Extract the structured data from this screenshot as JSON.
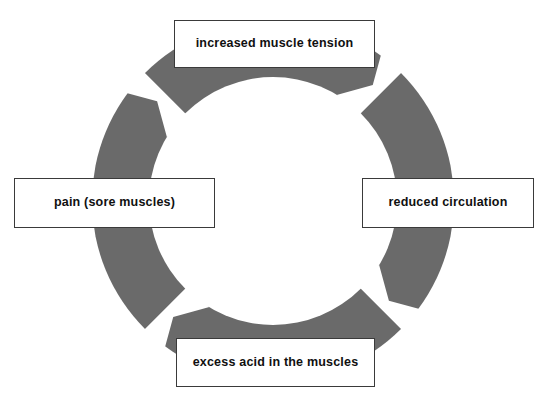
{
  "diagram": {
    "type": "cycle",
    "direction": "clockwise",
    "ring": {
      "color": "#6a6a6a",
      "center_x": 273,
      "center_y": 201,
      "outer_radius": 181,
      "inner_radius": 124,
      "arrow_count": 4
    },
    "box": {
      "fill": "#ffffff",
      "border_color": "#3a3a3a",
      "text_color": "#101010"
    },
    "nodes": [
      {
        "id": "tension",
        "position": "top",
        "label": "increased muscle tension"
      },
      {
        "id": "circulation",
        "position": "right",
        "label": "reduced circulation"
      },
      {
        "id": "acid",
        "position": "bottom",
        "label": "excess acid in the muscles"
      },
      {
        "id": "pain",
        "position": "left",
        "label": "pain (sore muscles)"
      }
    ],
    "arrows": [
      {
        "id": "arrow-top-right",
        "from": "tension",
        "to": "circulation",
        "points": "down-right"
      },
      {
        "id": "arrow-bottom-right",
        "from": "circulation",
        "to": "acid",
        "points": "down-left"
      },
      {
        "id": "arrow-bottom-left",
        "from": "acid",
        "to": "pain",
        "points": "up-left"
      },
      {
        "id": "arrow-top-left",
        "from": "pain",
        "to": "tension",
        "points": "up-right"
      }
    ]
  }
}
